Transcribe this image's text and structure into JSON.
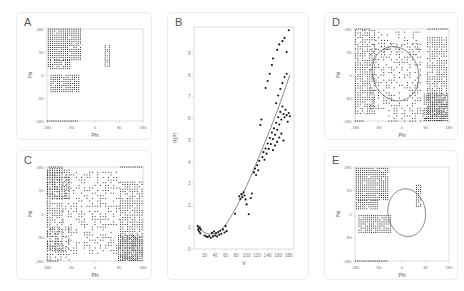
{
  "figure": {
    "background": "#ffffff",
    "panel_border": "#ededed",
    "dot_color": "#1a1a1a",
    "contour_color": "#4a4a4a"
  },
  "panels": [
    {
      "id": "A",
      "letter": "A",
      "type": "ramachandran",
      "has_contour": false
    },
    {
      "id": "B",
      "letter": "B",
      "type": "scatter_fit",
      "has_contour": false
    },
    {
      "id": "C",
      "letter": "C",
      "type": "ramachandran",
      "has_contour": false
    },
    {
      "id": "D",
      "letter": "D",
      "type": "ramachandran",
      "has_contour": true
    },
    {
      "id": "E",
      "letter": "E",
      "type": "ramachandran",
      "has_contour": true
    }
  ],
  "chart_data": [
    {
      "panel": "A",
      "type": "scatter",
      "title": "A",
      "xlabel": "Phi",
      "ylabel": "Psi",
      "xlim": [
        -180,
        180
      ],
      "ylim": [
        -180,
        180
      ],
      "xticks": [
        -180,
        -90,
        0,
        90,
        180
      ],
      "yticks": [
        -180,
        -90,
        0,
        90,
        180
      ],
      "xticklabels": [
        "-180",
        "-90",
        "0",
        "90",
        "180"
      ],
      "yticklabels": [
        "-180",
        "-90",
        "0",
        "90",
        "180"
      ],
      "grid": false,
      "legend": null,
      "clusters": [
        {
          "name": "beta-sheet-upper",
          "x_range": [
            -175,
            -55
          ],
          "y_range": [
            60,
            180
          ],
          "step": 8,
          "density": 0.95
        },
        {
          "name": "beta-sheet-extension",
          "x_range": [
            -175,
            -95
          ],
          "y_range": [
            25,
            60
          ],
          "step": 8,
          "density": 0.9
        },
        {
          "name": "alpha-helix",
          "x_range": [
            -165,
            -60
          ],
          "y_range": [
            -65,
            0
          ],
          "step": 8,
          "density": 0.9
        },
        {
          "name": "left-handed",
          "x_range": [
            38,
            58
          ],
          "y_range": [
            35,
            115
          ],
          "step": 8,
          "density": 0.85
        },
        {
          "name": "bottom-edge",
          "x_range": [
            -178,
            -60
          ],
          "y_range": [
            -180,
            -180
          ],
          "step": 7,
          "density": 1.0
        }
      ]
    },
    {
      "panel": "B",
      "type": "scatter",
      "title": "B",
      "xlabel": "V",
      "ylabel": "H(P)",
      "xlim": [
        0,
        190
      ],
      "ylim": [
        0,
        10.2
      ],
      "xticks": [
        20,
        40,
        60,
        80,
        100,
        120,
        140,
        160,
        180
      ],
      "yticks": [
        0,
        1,
        2,
        3,
        4,
        5,
        6,
        7,
        8,
        9
      ],
      "xticklabels": [
        "20",
        "40",
        "60",
        "80",
        "100",
        "120",
        "140",
        "160",
        "180"
      ],
      "yticklabels": [
        "0",
        "1",
        "2",
        "3",
        "4",
        "5",
        "6",
        "7",
        "8",
        "9"
      ],
      "grid": false,
      "legend": null,
      "fit_curve": {
        "label": "fitted curve",
        "points": [
          [
            8,
            1.02
          ],
          [
            14,
            0.86
          ],
          [
            20,
            0.76
          ],
          [
            26,
            0.7
          ],
          [
            32,
            0.68
          ],
          [
            38,
            0.7
          ],
          [
            44,
            0.76
          ],
          [
            50,
            0.86
          ],
          [
            56,
            1.0
          ],
          [
            62,
            1.18
          ],
          [
            68,
            1.4
          ],
          [
            74,
            1.64
          ],
          [
            80,
            1.9
          ],
          [
            86,
            2.18
          ],
          [
            92,
            2.48
          ],
          [
            98,
            2.8
          ],
          [
            104,
            3.12
          ],
          [
            110,
            3.46
          ],
          [
            116,
            3.8
          ],
          [
            122,
            4.15
          ],
          [
            128,
            4.5
          ],
          [
            134,
            4.86
          ],
          [
            140,
            5.22
          ],
          [
            146,
            5.58
          ],
          [
            152,
            5.96
          ],
          [
            158,
            6.34
          ],
          [
            164,
            6.74
          ],
          [
            170,
            7.14
          ],
          [
            176,
            7.56
          ],
          [
            182,
            8.0
          ]
        ]
      },
      "points": [
        [
          7,
          1.05
        ],
        [
          8,
          0.88
        ],
        [
          9,
          0.95
        ],
        [
          10,
          0.8
        ],
        [
          11,
          1.0
        ],
        [
          12,
          0.72
        ],
        [
          13,
          0.9
        ],
        [
          20,
          0.62
        ],
        [
          23,
          0.58
        ],
        [
          26,
          0.55
        ],
        [
          29,
          0.6
        ],
        [
          32,
          0.52
        ],
        [
          34,
          0.74
        ],
        [
          36,
          0.58
        ],
        [
          38,
          0.8
        ],
        [
          40,
          0.62
        ],
        [
          42,
          0.72
        ],
        [
          44,
          0.58
        ],
        [
          46,
          0.78
        ],
        [
          48,
          0.66
        ],
        [
          50,
          0.84
        ],
        [
          52,
          0.7
        ],
        [
          55,
          0.9
        ],
        [
          58,
          0.76
        ],
        [
          60,
          1.05
        ],
        [
          62,
          0.82
        ],
        [
          78,
          1.62
        ],
        [
          86,
          2.42
        ],
        [
          88,
          2.3
        ],
        [
          90,
          2.52
        ],
        [
          92,
          2.38
        ],
        [
          94,
          2.6
        ],
        [
          96,
          2.46
        ],
        [
          98,
          2.28
        ],
        [
          100,
          2.05
        ],
        [
          104,
          1.6
        ],
        [
          108,
          2.34
        ],
        [
          110,
          2.55
        ],
        [
          114,
          3.52
        ],
        [
          116,
          3.7
        ],
        [
          118,
          3.4
        ],
        [
          120,
          3.85
        ],
        [
          122,
          3.62
        ],
        [
          124,
          4.05
        ],
        [
          126,
          5.7
        ],
        [
          128,
          5.95
        ],
        [
          130,
          4.22
        ],
        [
          132,
          4.45
        ],
        [
          134,
          4.1
        ],
        [
          136,
          4.62
        ],
        [
          138,
          4.38
        ],
        [
          140,
          4.85
        ],
        [
          142,
          4.6
        ],
        [
          144,
          5.1
        ],
        [
          146,
          4.82
        ],
        [
          148,
          5.35
        ],
        [
          150,
          5.05
        ],
        [
          152,
          5.55
        ],
        [
          154,
          5.25
        ],
        [
          156,
          5.8
        ],
        [
          158,
          5.48
        ],
        [
          160,
          6.05
        ],
        [
          162,
          5.72
        ],
        [
          164,
          6.3
        ],
        [
          166,
          5.95
        ],
        [
          168,
          6.55
        ],
        [
          170,
          6.2
        ],
        [
          172,
          6.05
        ],
        [
          174,
          6.4
        ],
        [
          176,
          6.15
        ],
        [
          178,
          5.85
        ],
        [
          180,
          6.25
        ],
        [
          182,
          6.1
        ],
        [
          150,
          4.55
        ],
        [
          154,
          4.75
        ],
        [
          158,
          4.92
        ],
        [
          162,
          5.12
        ],
        [
          166,
          5.3
        ],
        [
          170,
          4.98
        ],
        [
          156,
          6.7
        ],
        [
          160,
          7.05
        ],
        [
          164,
          7.35
        ],
        [
          168,
          7.62
        ],
        [
          172,
          7.9
        ],
        [
          176,
          8.05
        ],
        [
          150,
          8.75
        ],
        [
          158,
          9.15
        ],
        [
          162,
          9.4
        ],
        [
          168,
          9.55
        ],
        [
          172,
          9.7
        ],
        [
          148,
          8.45
        ],
        [
          144,
          8.05
        ],
        [
          140,
          7.72
        ],
        [
          136,
          7.4
        ],
        [
          180,
          10.05
        ],
        [
          176,
          9.05
        ]
      ]
    },
    {
      "panel": "C",
      "type": "scatter",
      "title": "C",
      "xlabel": "Phi",
      "ylabel": "Psi",
      "xlim": [
        -180,
        180
      ],
      "ylim": [
        -180,
        180
      ],
      "xticks": [
        -180,
        -90,
        0,
        90,
        180
      ],
      "yticks": [
        -180,
        -90,
        0,
        90,
        180
      ],
      "xticklabels": [
        "-180",
        "-90",
        "0",
        "90",
        "180"
      ],
      "yticklabels": [
        "-180",
        "-90",
        "0",
        "90",
        "180"
      ],
      "grid": false,
      "legend": null,
      "clusters": [
        {
          "name": "left-band",
          "x_range": [
            -178,
            -118
          ],
          "y_range": [
            -140,
            180
          ],
          "step": 9,
          "density": 0.78
        },
        {
          "name": "upper-left-block",
          "x_range": [
            -178,
            -95
          ],
          "y_range": [
            60,
            175
          ],
          "step": 9,
          "density": 0.82
        },
        {
          "name": "top-edge",
          "x_range": [
            -172,
            -120
          ],
          "y_range": [
            180,
            180
          ],
          "step": 8,
          "density": 1.0
        },
        {
          "name": "top-right-edge",
          "x_range": [
            95,
            175
          ],
          "y_range": [
            180,
            180
          ],
          "step": 8,
          "density": 1.0
        },
        {
          "name": "right-block",
          "x_range": [
            95,
            178
          ],
          "y_range": [
            -175,
            130
          ],
          "step": 9,
          "density": 0.8
        },
        {
          "name": "lower-right-block",
          "x_range": [
            88,
            178
          ],
          "y_range": [
            -178,
            -80
          ],
          "step": 8,
          "density": 0.92
        },
        {
          "name": "diagonal-arc",
          "x_range": [
            -120,
            90
          ],
          "y_range": [
            -150,
            160
          ],
          "step": 10,
          "density": 0.45
        },
        {
          "name": "lower-left-scatter",
          "x_range": [
            -178,
            -95
          ],
          "y_range": [
            -175,
            -55
          ],
          "step": 10,
          "density": 0.6
        },
        {
          "name": "bottom-edge",
          "x_range": [
            -176,
            -140
          ],
          "y_range": [
            -180,
            -180
          ],
          "step": 7,
          "density": 1.0
        }
      ]
    },
    {
      "panel": "D",
      "type": "scatter",
      "title": "D",
      "xlabel": "Phi",
      "ylabel": "Psi",
      "xlim": [
        -180,
        180
      ],
      "ylim": [
        -180,
        180
      ],
      "xticks": [
        -180,
        -90,
        0,
        90,
        180
      ],
      "yticks": [
        -180,
        -90,
        0,
        90,
        180
      ],
      "xticklabels": [
        "-180",
        "-90",
        "0",
        "90",
        "180"
      ],
      "yticklabels": [
        "-180",
        "-90",
        "0",
        "90",
        "180"
      ],
      "grid": false,
      "legend": null,
      "contour": {
        "shape": "ellipse",
        "cx": -25,
        "cy": 5,
        "rx": 88,
        "ry": 108,
        "rotation": -18
      },
      "clusters": [
        {
          "name": "left-block",
          "x_range": [
            -178,
            -105
          ],
          "y_range": [
            -150,
            175
          ],
          "step": 9,
          "density": 0.8
        },
        {
          "name": "top-left-edge",
          "x_range": [
            -175,
            -120
          ],
          "y_range": [
            180,
            180
          ],
          "step": 8,
          "density": 1.0
        },
        {
          "name": "top-right-edge",
          "x_range": [
            100,
            178
          ],
          "y_range": [
            180,
            180
          ],
          "step": 8,
          "density": 1.0
        },
        {
          "name": "right-block",
          "x_range": [
            98,
            178
          ],
          "y_range": [
            -178,
            150
          ],
          "step": 9,
          "density": 0.82
        },
        {
          "name": "lower-right-block",
          "x_range": [
            85,
            178
          ],
          "y_range": [
            -178,
            -70
          ],
          "step": 8,
          "density": 0.92
        },
        {
          "name": "upper-center",
          "x_range": [
            -100,
            75
          ],
          "y_range": [
            80,
            178
          ],
          "step": 11,
          "density": 0.42
        },
        {
          "name": "ellipse-rim",
          "x_range": [
            -120,
            75
          ],
          "y_range": [
            -130,
            120
          ],
          "step": 10,
          "density": 0.38
        },
        {
          "name": "bottom-edge",
          "x_range": [
            -178,
            -145
          ],
          "y_range": [
            -180,
            -180
          ],
          "step": 7,
          "density": 1.0
        },
        {
          "name": "bottom-center",
          "x_range": [
            -60,
            90
          ],
          "y_range": [
            -180,
            -140
          ],
          "step": 10,
          "density": 0.5
        }
      ]
    },
    {
      "panel": "E",
      "type": "scatter",
      "title": "E",
      "xlabel": "Phi",
      "ylabel": "Psi",
      "xlim": [
        -180,
        180
      ],
      "ylim": [
        -180,
        180
      ],
      "xticks": [
        -180,
        -90,
        0,
        90,
        180
      ],
      "yticks": [
        -180,
        -90,
        0,
        90,
        180
      ],
      "xticklabels": [
        "-180",
        "-90",
        "0",
        "90",
        "180"
      ],
      "yticklabels": [
        "-180",
        "-90",
        "0",
        "90",
        "180"
      ],
      "grid": false,
      "legend": null,
      "contour": {
        "shape": "ellipse",
        "cx": 18,
        "cy": 5,
        "rx": 72,
        "ry": 92,
        "rotation": -8
      },
      "clusters": [
        {
          "name": "beta-sheet-upper",
          "x_range": [
            -175,
            -50
          ],
          "y_range": [
            55,
            180
          ],
          "step": 8,
          "density": 0.95
        },
        {
          "name": "beta-sheet-extension",
          "x_range": [
            -175,
            -90
          ],
          "y_range": [
            20,
            55
          ],
          "step": 8,
          "density": 0.9
        },
        {
          "name": "alpha-helix",
          "x_range": [
            -165,
            -45
          ],
          "y_range": [
            -70,
            0
          ],
          "step": 8,
          "density": 0.9
        },
        {
          "name": "left-handed",
          "x_range": [
            55,
            78
          ],
          "y_range": [
            30,
            110
          ],
          "step": 8,
          "density": 0.85
        },
        {
          "name": "bottom-edge",
          "x_range": [
            -178,
            -55
          ],
          "y_range": [
            -180,
            -180
          ],
          "step": 7,
          "density": 1.0
        }
      ]
    }
  ]
}
